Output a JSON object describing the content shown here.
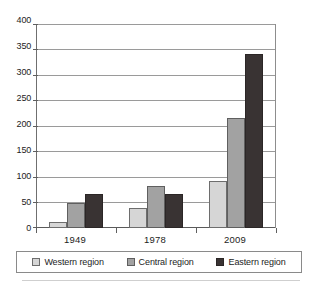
{
  "chart_data": {
    "type": "bar",
    "title": "",
    "subtitle": "",
    "xlabel": "",
    "ylabel": "",
    "categories": [
      "1949",
      "1978",
      "2009"
    ],
    "series": [
      {
        "name": "Western region",
        "values": [
          12,
          39,
          92
        ],
        "color": "#d6d6d6"
      },
      {
        "name": "Central region",
        "values": [
          50,
          83,
          215
        ],
        "color": "#a2a2a2"
      },
      {
        "name": "Eastern region",
        "values": [
          67,
          66,
          341
        ],
        "color": "#393333"
      }
    ],
    "ylim": [
      0,
      400
    ],
    "yticks": [
      0,
      50,
      100,
      150,
      200,
      250,
      300,
      350,
      400
    ],
    "ytick_labels": [
      "0",
      "50",
      "100",
      "150",
      "200",
      "250",
      "300",
      "350",
      "400"
    ],
    "grid": true,
    "grid_axis": "y",
    "legend": true,
    "legend_position": "bottom",
    "bar_orientation": "vertical",
    "grouping": "clustered"
  },
  "legend": {
    "items": [
      {
        "label": "Western region",
        "swatch": "legend-swatch-western"
      },
      {
        "label": "Central region",
        "swatch": "legend-swatch-central"
      },
      {
        "label": "Eastern region",
        "swatch": "legend-swatch-eastern"
      }
    ]
  },
  "caption": {
    "clipped_text": ""
  }
}
